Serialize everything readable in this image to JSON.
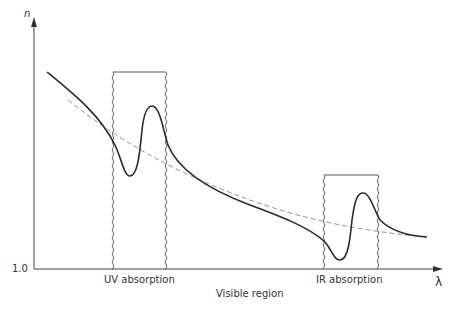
{
  "diagram": {
    "y_axis": {
      "label": "n",
      "baseline_label": "1.0"
    },
    "x_axis": {
      "label": "λ"
    },
    "regions": [
      {
        "name": "uv-absorption",
        "label": "UV absorption"
      },
      {
        "name": "ir-absorption",
        "label": "IR absorption"
      }
    ],
    "visible_region_label": "Visible region",
    "curves": [
      {
        "name": "actual-dispersion-curve",
        "style": "solid"
      },
      {
        "name": "normal-dispersion-curve",
        "style": "dashed"
      }
    ],
    "colors": {
      "line": "#2a2a2a",
      "dashed": "#888888",
      "box": "#555555"
    }
  }
}
